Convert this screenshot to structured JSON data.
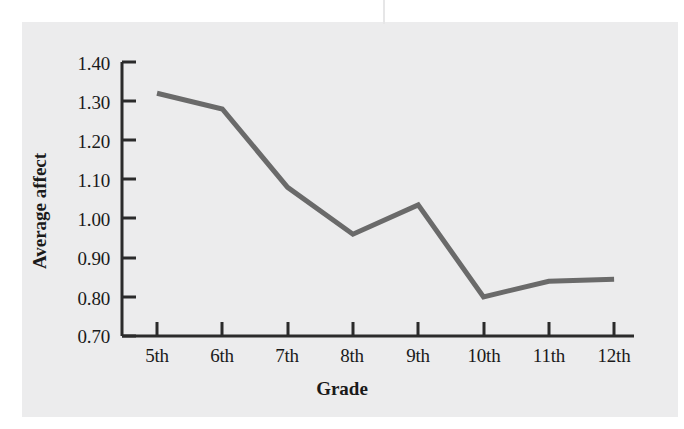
{
  "chart_data": {
    "type": "line",
    "title": "",
    "xlabel": "Grade",
    "ylabel": "Average affect",
    "categories": [
      "5th",
      "6th",
      "7th",
      "8th",
      "9th",
      "10th",
      "11th",
      "12th"
    ],
    "values": [
      1.32,
      1.28,
      1.08,
      0.96,
      1.035,
      0.8,
      0.84,
      0.845
    ],
    "series": [
      {
        "name": "Average affect",
        "values": [
          1.32,
          1.28,
          1.08,
          0.96,
          1.035,
          0.8,
          0.84,
          0.845
        ]
      }
    ],
    "ylim": [
      0.7,
      1.4
    ],
    "ytick_values": [
      0.7,
      0.8,
      0.9,
      1.0,
      1.1,
      1.2,
      1.3,
      1.4
    ],
    "ytick_labels": [
      "0.70",
      "0.80",
      "0.90",
      "1.00",
      "1.10",
      "1.20",
      "1.30",
      "1.40"
    ],
    "xtick_labels": [
      "5th",
      "6th",
      "7th",
      "8th",
      "9th",
      "10th",
      "11th",
      "12th"
    ],
    "grid": false,
    "legend": false,
    "legend_position": "none",
    "line_color": "#6a6a6a",
    "axis_color": "#2b2b2b",
    "background_color": "#ececed",
    "page_color": "#ffffff",
    "line_width": 5,
    "markers": false
  }
}
